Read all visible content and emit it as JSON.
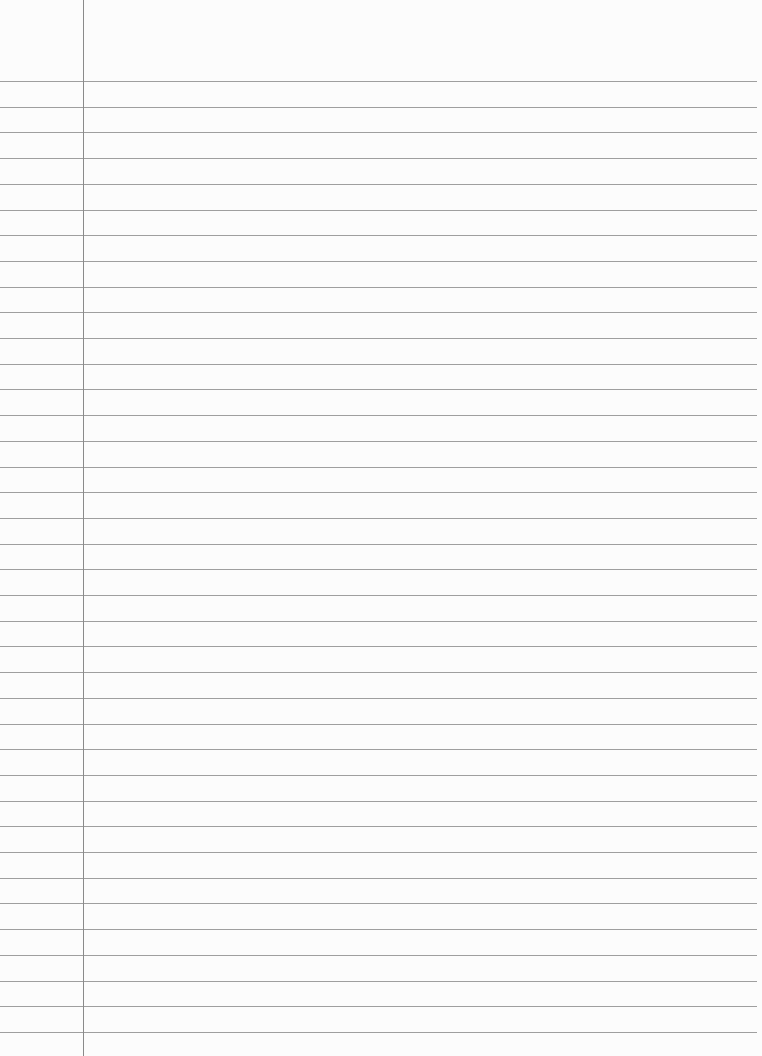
{
  "page": {
    "type": "lined-paper",
    "background_color": "#fcfcfc",
    "text_content": ""
  },
  "rules": {
    "count": 38,
    "first_y": 81,
    "spacing": 25.7,
    "right_end_x": 757,
    "color": "#8e8e8e"
  },
  "margin": {
    "x": 83,
    "top": 0,
    "bottom": 1056,
    "color": "#8a8a8a"
  }
}
